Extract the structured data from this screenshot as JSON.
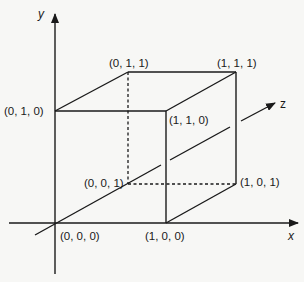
{
  "diagram": {
    "type": "unit-cube-3d-coordinates",
    "axes": {
      "x": "x",
      "y": "y",
      "z": "z"
    },
    "vertices": {
      "v000": "(0, 0, 0)",
      "v100": "(1, 0, 0)",
      "v010": "(0, 1, 0)",
      "v001": "(0, 0, 1)",
      "v110": "(1, 1, 0)",
      "v011": "(0, 1, 1)",
      "v101": "(1, 0, 1)",
      "v111": "(1, 1, 1)"
    },
    "colors": {
      "line": "#1a1a1a",
      "background": "#f7f7f5"
    }
  }
}
